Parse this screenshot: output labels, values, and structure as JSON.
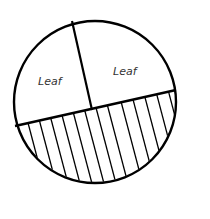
{
  "diagram": {
    "type": "sectioned-circle",
    "regions": [
      {
        "id": "upper-left",
        "label": "Leaf",
        "fill": "none"
      },
      {
        "id": "upper-right",
        "label": "Leaf",
        "fill": "none"
      },
      {
        "id": "lower",
        "label": "",
        "fill": "vertical-hatch"
      }
    ],
    "colors": {
      "stroke": "#000000",
      "background": "#ffffff",
      "label": "#333333"
    }
  }
}
